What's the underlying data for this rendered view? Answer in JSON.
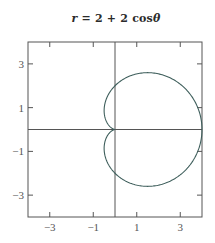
{
  "chart_data": {
    "type": "line",
    "title": "r = 2 + 2 cosθ",
    "title_parts": {
      "lhs": "r",
      "rhs": "= 2 + 2 cos",
      "var": "θ"
    },
    "equation": {
      "form": "polar",
      "a": 2,
      "b": 2,
      "func": "cos"
    },
    "theta_range": [
      0,
      6.283185307
    ],
    "xlabel": "",
    "ylabel": "",
    "xlim": [
      -4,
      4
    ],
    "ylim": [
      -4,
      4
    ],
    "xticks": [
      -3,
      -1,
      1,
      3
    ],
    "yticks": [
      -3,
      -1,
      1,
      3
    ],
    "xtick_labels": [
      "−3",
      "−1",
      "1",
      "3"
    ],
    "ytick_labels": [
      "−3",
      "−1",
      "1",
      "3"
    ],
    "axes_lines_through_origin": true,
    "grid": false,
    "legend": null,
    "series": [
      {
        "name": "cardioid",
        "color": "#3f5f5c",
        "description": "cardioid r = 2 + 2cosθ, cusp at origin, max x = 4, max |y| ≈ 2.6 at x = 1.5"
      }
    ]
  },
  "colors": {
    "frame": "#555555",
    "axis": "#555555",
    "curve": "#3f5f5c",
    "text": "#2b2b2b"
  }
}
